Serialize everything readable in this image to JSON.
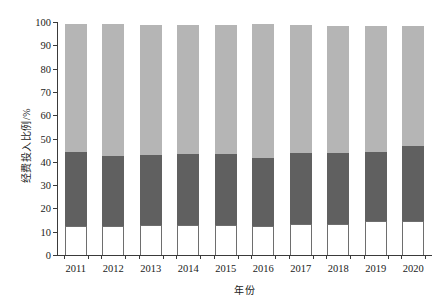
{
  "chart_data": {
    "type": "bar",
    "subtype": "stacked-percentage",
    "title": "",
    "xlabel": "年份",
    "ylabel": "经费投入比例/%",
    "categories": [
      "2011",
      "2012",
      "2013",
      "2014",
      "2015",
      "2016",
      "2017",
      "2018",
      "2019",
      "2020"
    ],
    "ylim": [
      0,
      100
    ],
    "ytick_labels": [
      "0",
      "10",
      "20",
      "30",
      "40",
      "50",
      "60",
      "70",
      "80",
      "90",
      "100"
    ],
    "ytick_values": [
      0,
      10,
      20,
      30,
      40,
      50,
      60,
      70,
      80,
      90,
      100
    ],
    "grid": false,
    "legend_position": "none",
    "series": [
      {
        "name": "bottom-segment",
        "color": "#ffffff",
        "values": [
          12.3,
          12.6,
          12.8,
          12.7,
          12.7,
          12.5,
          13.2,
          13.4,
          14.6,
          14.8
        ]
      },
      {
        "name": "middle-segment",
        "color": "#606060",
        "values": [
          31.7,
          30.1,
          30.2,
          30.6,
          30.5,
          29.0,
          30.6,
          30.2,
          29.7,
          32.2
        ]
      },
      {
        "name": "top-segment",
        "color": "#b5b5b5",
        "values": [
          55.0,
          56.3,
          55.9,
          55.4,
          55.6,
          57.5,
          54.9,
          54.8,
          54.0,
          51.1
        ]
      }
    ],
    "segment_tops": {
      "bottom_cumulative": [
        12.3,
        12.6,
        12.8,
        12.7,
        12.7,
        12.5,
        13.2,
        13.4,
        14.6,
        14.8
      ],
      "middle_cumulative": [
        44.0,
        42.7,
        43.0,
        43.3,
        43.2,
        41.5,
        43.8,
        43.6,
        44.3,
        47.0
      ],
      "total": [
        99.0,
        99.0,
        98.9,
        98.7,
        98.8,
        99.0,
        98.7,
        98.4,
        98.3,
        98.1
      ]
    }
  }
}
